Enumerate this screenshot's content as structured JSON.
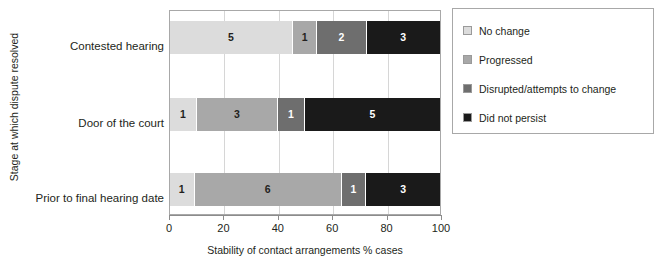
{
  "chart_data": {
    "type": "bar",
    "orientation": "horizontal",
    "stacked": true,
    "normalized": true,
    "title": "",
    "xlabel": "Stability of contact arrangements % cases",
    "ylabel": "Stage at which dispute resolved",
    "xlim": [
      0,
      100
    ],
    "xticks": [
      0,
      20,
      40,
      60,
      80,
      100
    ],
    "xtick_labels": [
      "0",
      "20",
      "40",
      "60",
      "80",
      "100"
    ],
    "grid": true,
    "legend_position": "right",
    "categories": [
      "Contested hearing",
      "Door of the court",
      "Prior to final hearing date"
    ],
    "series": [
      {
        "name": "No change",
        "color": "#dcdcdc",
        "values": [
          5,
          1,
          1
        ],
        "percents": [
          45.5,
          10.0,
          9.1
        ]
      },
      {
        "name": "Progressed",
        "color": "#a8a8a8",
        "values": [
          1,
          3,
          6
        ],
        "percents": [
          9.1,
          30.0,
          54.5
        ]
      },
      {
        "name": "Disrupted/attempts to change",
        "color": "#6e6e6e",
        "values": [
          2,
          1,
          1
        ],
        "percents": [
          18.2,
          10.0,
          9.1
        ]
      },
      {
        "name": "Did not persist",
        "color": "#1a1a1a",
        "values": [
          3,
          5,
          3
        ],
        "percents": [
          27.2,
          50.0,
          27.3
        ]
      }
    ],
    "bar_labels": [
      [
        "5",
        "1",
        "2",
        "3"
      ],
      [
        "1",
        "3",
        "1",
        "5"
      ],
      [
        "1",
        "6",
        "1",
        "3"
      ]
    ]
  },
  "legend": {
    "items": [
      {
        "label": "No change",
        "color": "#dcdcdc"
      },
      {
        "label": "Progressed",
        "color": "#a8a8a8"
      },
      {
        "label": "Disrupted/attempts to change",
        "color": "#6e6e6e"
      },
      {
        "label": "Did not persist",
        "color": "#1a1a1a"
      }
    ]
  }
}
